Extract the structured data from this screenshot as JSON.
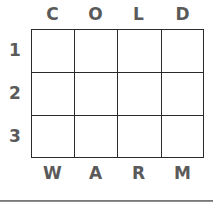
{
  "diagram": {
    "type": "letter-grid",
    "top_labels": [
      "C",
      "O",
      "L",
      "D"
    ],
    "bottom_labels": [
      "W",
      "A",
      "R",
      "M"
    ],
    "row_labels": [
      "1",
      "2",
      "3"
    ],
    "rows": 3,
    "columns": 4,
    "cells": [
      [
        "",
        "",
        "",
        ""
      ],
      [
        "",
        "",
        "",
        ""
      ],
      [
        "",
        "",
        "",
        ""
      ]
    ],
    "colors": {
      "label": "#5a5a5a",
      "grid_line": "#2a2a2a",
      "rule": "#7a7a7a"
    }
  }
}
